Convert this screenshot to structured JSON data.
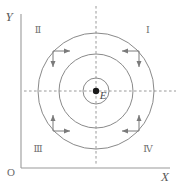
{
  "figure": {
    "background_color": "#ffffff",
    "width": 179,
    "height": 185
  },
  "axes": {
    "y_axis_label": "Y",
    "x_axis_label": "X",
    "origin_label": "O",
    "axis_color": "#9a9a9a",
    "origin_px": {
      "x": 21,
      "y": 168
    },
    "y_axis_top_px": {
      "x": 21,
      "y": 14
    },
    "x_axis_right_px": {
      "x": 170,
      "y": 168
    }
  },
  "center": {
    "label": "E",
    "dot_color": "#1a1a1a",
    "dot_radius_px": 3.2,
    "x_px": 96,
    "y_px": 91
  },
  "guide_lines": {
    "color": "#9a9a9a",
    "style": "dashed",
    "horizontal": {
      "y_px": 91,
      "x_start_px": 24,
      "x_end_px": 176
    },
    "vertical": {
      "x_px": 96,
      "y_start_px": 6,
      "y_end_px": 166
    }
  },
  "circles": {
    "color": "#8a8a8a",
    "stroke_width": 1.0,
    "radii_px": [
      13,
      37,
      58
    ]
  },
  "quadrants": [
    {
      "name": "quadrant-one",
      "label": "Ⅰ",
      "x_px": 148,
      "y_px": 33
    },
    {
      "name": "quadrant-two",
      "label": "Ⅱ",
      "x_px": 38,
      "y_px": 33
    },
    {
      "name": "quadrant-three",
      "label": "Ⅲ",
      "x_px": 38,
      "y_px": 152
    },
    {
      "name": "quadrant-four",
      "label": "Ⅳ",
      "x_px": 148,
      "y_px": 152
    }
  ],
  "arrow_markers": {
    "color": "#7a7a7a",
    "description": "L-shaped corner arrow pairs indicating clockwise circulation of field lines",
    "items": [
      {
        "name": "arrow-pair-upper-left",
        "directions": [
          "right",
          "down"
        ]
      },
      {
        "name": "arrow-pair-upper-right",
        "directions": [
          "left",
          "down"
        ]
      },
      {
        "name": "arrow-pair-lower-left",
        "directions": [
          "up",
          "right"
        ]
      },
      {
        "name": "arrow-pair-lower-right",
        "directions": [
          "up",
          "left"
        ]
      }
    ]
  }
}
